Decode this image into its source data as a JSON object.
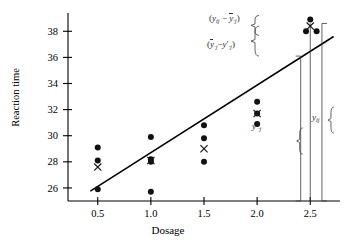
{
  "chart_data": {
    "type": "scatter",
    "title": "",
    "xlabel": "Dosage",
    "ylabel": "Reaction time",
    "xlim": [
      0.22,
      2.78
    ],
    "ylim": [
      25.0,
      39.4
    ],
    "xticks": [
      "0.5",
      "1.0",
      "1.5",
      "2.0",
      "2.5"
    ],
    "xtick_values": [
      0.5,
      1.0,
      1.5,
      2.0,
      2.5
    ],
    "yticks": [
      "26",
      "28",
      "30",
      "32",
      "34",
      "36",
      "38"
    ],
    "ytick_values": [
      26,
      28,
      30,
      32,
      34,
      36,
      38
    ],
    "grid": false,
    "legend": null,
    "series": [
      {
        "name": "observations",
        "marker": "filled-circle",
        "points": [
          {
            "x": 0.5,
            "y": 29.1
          },
          {
            "x": 0.5,
            "y": 28.1
          },
          {
            "x": 0.5,
            "y": 25.9
          },
          {
            "x": 1.0,
            "y": 29.9
          },
          {
            "x": 1.0,
            "y": 28.2
          },
          {
            "x": 1.0,
            "y": 28.0
          },
          {
            "x": 1.0,
            "y": 25.7
          },
          {
            "x": 1.5,
            "y": 30.8
          },
          {
            "x": 1.5,
            "y": 29.8
          },
          {
            "x": 1.5,
            "y": 28.0
          },
          {
            "x": 2.0,
            "y": 32.6
          },
          {
            "x": 2.0,
            "y": 31.7
          },
          {
            "x": 2.0,
            "y": 30.9
          },
          {
            "x": 2.5,
            "y": 38.9
          },
          {
            "x": 2.46,
            "y": 38.0
          },
          {
            "x": 2.56,
            "y": 38.0
          }
        ]
      },
      {
        "name": "group-means",
        "marker": "x-cross",
        "points": [
          {
            "x": 0.5,
            "y": 27.6
          },
          {
            "x": 1.0,
            "y": 28.1
          },
          {
            "x": 1.5,
            "y": 29.0
          },
          {
            "x": 2.0,
            "y": 31.7
          },
          {
            "x": 2.5,
            "y": 38.4
          }
        ]
      }
    ],
    "fit_line": {
      "name": "regression-line",
      "x_start": 0.43,
      "y_start": 25.75,
      "x_end": 2.72,
      "y_end": 37.6
    },
    "annotations": [
      {
        "name": "within-group-deviation",
        "text": "( y_ij − ȳ_·j )",
        "target_x": 2.5,
        "y_from": 38.0,
        "y_to": 38.9
      },
      {
        "name": "lack-of-fit-deviation",
        "text": "( ȳ_·j − y′_·j )",
        "target_x": 2.5,
        "y_from": 36.1,
        "y_to": 38.4
      },
      {
        "name": "fitted-value",
        "text": "y′_·j",
        "target_x": 2.41,
        "y_from": 25.0,
        "y_to": 36.1
      },
      {
        "name": "observed-value",
        "text": "y_ij",
        "target_x": 2.61,
        "y_from": 25.0,
        "y_to": 38.6
      }
    ]
  },
  "labels": {
    "y_axis_title": "Reaction time",
    "x_axis_title": "Dosage",
    "xticks": [
      "0.5",
      "1.0",
      "1.5",
      "2.0",
      "2.5"
    ],
    "yticks": [
      "26",
      "28",
      "30",
      "32",
      "34",
      "36",
      "38"
    ]
  },
  "annotation_text": {
    "within_group_open": "(",
    "within_group_y": "y",
    "within_group_sub1": "ij",
    "within_group_minus": "−",
    "within_group_ybar": "y",
    "within_group_sub2": "·j",
    "within_group_close": ")",
    "lackfit_open": "(",
    "lackfit_ybar": "y",
    "lackfit_sub1": "·j",
    "lackfit_minus": "−",
    "lackfit_y": "y",
    "lackfit_prime": "′",
    "lackfit_sub2": "·j",
    "lackfit_close": ")",
    "fitted_y": "y",
    "fitted_prime": "′",
    "fitted_sub": "·j",
    "observed_y": "y",
    "observed_sub": "ij"
  },
  "colors": {
    "axis": "#000000",
    "marker": "#111111",
    "line": "#000000",
    "bracket": "#3b3b3b",
    "background": "#ffffff"
  }
}
